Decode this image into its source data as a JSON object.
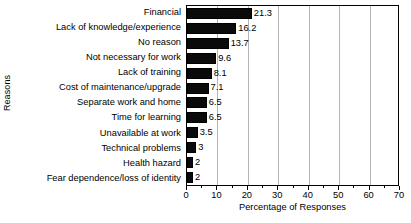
{
  "chart_data": {
    "type": "bar",
    "orientation": "horizontal",
    "title": "",
    "xlabel": "Percentage of Responses",
    "ylabel": "Reasons",
    "xlim": [
      0,
      70
    ],
    "xticks": [
      0,
      10,
      20,
      30,
      40,
      50,
      60,
      70
    ],
    "xtick_labels": [
      "0",
      "10",
      "20",
      "30",
      "40",
      "50",
      "60",
      "70"
    ],
    "minor_tick_step": 5,
    "grid": "vertical",
    "legend": null,
    "bar_color": "#000000",
    "grid_color": "#b4b4b4",
    "axis_color": "#000000",
    "categories": [
      "Financial",
      "Lack of knowledge/experience",
      "No reason",
      "Not necessary for work",
      "Lack of training",
      "Cost of maintenance/upgrade",
      "Separate work and home",
      "Time for learning",
      "Unavailable at work",
      "Technical problems",
      "Health hazard",
      "Fear dependence/loss of identity"
    ],
    "values": [
      21.3,
      16.2,
      13.7,
      9.6,
      8.1,
      7.1,
      6.5,
      6.5,
      3.5,
      3,
      2,
      2
    ],
    "value_labels": [
      "21.3",
      "16.2",
      "13.7",
      "9.6",
      "8.1",
      "7.1",
      "6.5",
      "6.5",
      "3.5",
      "3",
      "2",
      "2"
    ]
  }
}
